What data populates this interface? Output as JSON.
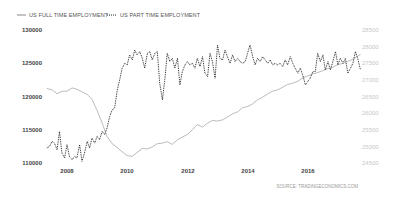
{
  "chart_data": {
    "type": "line",
    "title": "",
    "legend": [
      {
        "name": "US FULL TIME EMPLOYMENT",
        "style": "solid",
        "color": "#aaaaaa",
        "axis": "left"
      },
      {
        "name": "US PART TIME EMPLOYMENT",
        "style": "dotted",
        "color": "#222222",
        "axis": "right"
      }
    ],
    "legend_position": "top-left",
    "xlabel": "",
    "x_ticks": [
      "2008",
      "2010",
      "2012",
      "2014",
      "2016"
    ],
    "y_left": {
      "ticks": [
        "130000",
        "125000",
        "120000",
        "115000",
        "110000"
      ],
      "ylim": [
        110000,
        130000
      ]
    },
    "y_right": {
      "ticks": [
        "28500",
        "28000",
        "27500",
        "27000",
        "26500",
        "26000",
        "25500",
        "25000",
        "24500"
      ],
      "ylim": [
        24500,
        28500
      ]
    },
    "grid": false,
    "source": "SOURCE: TRADINGECONOMICS.COM",
    "x_range": [
      2007.33,
      2017.75
    ],
    "series": [
      {
        "name": "US FULL TIME EMPLOYMENT",
        "axis": "left",
        "x": [
          2007.33,
          2007.5,
          2007.67,
          2007.83,
          2008.0,
          2008.17,
          2008.33,
          2008.5,
          2008.67,
          2008.83,
          2009.0,
          2009.17,
          2009.33,
          2009.5,
          2009.67,
          2009.83,
          2010.0,
          2010.17,
          2010.33,
          2010.5,
          2010.67,
          2010.83,
          2011.0,
          2011.17,
          2011.33,
          2011.5,
          2011.67,
          2011.83,
          2012.0,
          2012.17,
          2012.33,
          2012.5,
          2012.67,
          2012.83,
          2013.0,
          2013.17,
          2013.33,
          2013.5,
          2013.67,
          2013.83,
          2014.0,
          2014.17,
          2014.33,
          2014.5,
          2014.67,
          2014.83,
          2015.0,
          2015.17,
          2015.33,
          2015.5,
          2015.67,
          2015.83,
          2016.0,
          2016.17,
          2016.33,
          2016.5,
          2016.67,
          2016.83,
          2017.0,
          2017.17,
          2017.33,
          2017.5,
          2017.67,
          2017.75
        ],
        "values": [
          121200,
          121000,
          120400,
          120800,
          120800,
          121300,
          121100,
          120700,
          120300,
          119600,
          117900,
          116000,
          114000,
          112900,
          112300,
          111700,
          111100,
          111000,
          111600,
          112200,
          112100,
          112400,
          112900,
          113000,
          113200,
          112800,
          113500,
          113900,
          114300,
          115000,
          115800,
          115400,
          116000,
          116400,
          116300,
          116500,
          116900,
          117400,
          117700,
          118300,
          118500,
          118900,
          119500,
          119900,
          120400,
          120800,
          121000,
          121400,
          121800,
          122000,
          122300,
          122800,
          123100,
          123400,
          123600,
          123900,
          124200,
          124400,
          124800,
          125000,
          125300,
          125600,
          126100,
          126300
        ]
      },
      {
        "name": "US PART TIME EMPLOYMENT",
        "axis": "right",
        "x": [
          2007.33,
          2007.42,
          2007.5,
          2007.58,
          2007.67,
          2007.75,
          2007.83,
          2007.92,
          2008.0,
          2008.08,
          2008.17,
          2008.25,
          2008.33,
          2008.42,
          2008.5,
          2008.58,
          2008.67,
          2008.75,
          2008.83,
          2008.92,
          2009.0,
          2009.08,
          2009.17,
          2009.25,
          2009.33,
          2009.42,
          2009.5,
          2009.58,
          2009.67,
          2009.75,
          2009.83,
          2009.92,
          2010.0,
          2010.08,
          2010.17,
          2010.25,
          2010.33,
          2010.42,
          2010.5,
          2010.58,
          2010.67,
          2010.75,
          2010.83,
          2010.92,
          2011.0,
          2011.08,
          2011.17,
          2011.25,
          2011.33,
          2011.42,
          2011.5,
          2011.58,
          2011.67,
          2011.75,
          2011.83,
          2011.92,
          2012.0,
          2012.08,
          2012.17,
          2012.25,
          2012.33,
          2012.42,
          2012.5,
          2012.58,
          2012.67,
          2012.75,
          2012.83,
          2012.92,
          2013.0,
          2013.08,
          2013.17,
          2013.25,
          2013.33,
          2013.42,
          2013.5,
          2013.58,
          2013.67,
          2013.75,
          2013.83,
          2013.92,
          2014.0,
          2014.08,
          2014.17,
          2014.25,
          2014.33,
          2014.42,
          2014.5,
          2014.58,
          2014.67,
          2014.75,
          2014.83,
          2014.92,
          2015.0,
          2015.08,
          2015.17,
          2015.25,
          2015.33,
          2015.42,
          2015.5,
          2015.58,
          2015.67,
          2015.75,
          2015.83,
          2015.92,
          2016.0,
          2016.08,
          2016.17,
          2016.25,
          2016.33,
          2016.42,
          2016.5,
          2016.58,
          2016.67,
          2016.75,
          2016.83,
          2016.92,
          2017.0,
          2017.08,
          2017.17,
          2017.25,
          2017.33,
          2017.42,
          2017.5,
          2017.58,
          2017.67,
          2017.75
        ],
        "values": [
          24950,
          25000,
          25150,
          25100,
          24900,
          25450,
          24800,
          24650,
          25050,
          24700,
          24600,
          24700,
          24650,
          25050,
          24550,
          24800,
          25150,
          24950,
          25250,
          25100,
          25300,
          25200,
          25450,
          25350,
          25550,
          25900,
          26100,
          26150,
          26700,
          27000,
          27350,
          27500,
          27450,
          27750,
          27600,
          27900,
          27750,
          27850,
          27650,
          27350,
          27800,
          27850,
          27600,
          27800,
          27850,
          26900,
          26400,
          27000,
          27800,
          27550,
          27650,
          27350,
          27650,
          26850,
          27250,
          27450,
          27550,
          27450,
          27500,
          27350,
          27650,
          27400,
          27700,
          27200,
          27100,
          27800,
          27550,
          27050,
          28050,
          27650,
          27600,
          27900,
          27700,
          27500,
          27750,
          27550,
          27650,
          27550,
          27500,
          27550,
          27800,
          28050,
          27700,
          27450,
          27650,
          27550,
          27700,
          27600,
          27500,
          27600,
          27450,
          27500,
          27450,
          27500,
          27400,
          27600,
          27450,
          27700,
          27500,
          27350,
          27200,
          27350,
          27150,
          26850,
          26950,
          27050,
          27250,
          27250,
          27800,
          27550,
          27750,
          27300,
          27550,
          27300,
          27550,
          27850,
          27450,
          27650,
          27500,
          27650,
          27200,
          27350,
          27500,
          27850,
          27600,
          27300
        ]
      }
    ]
  },
  "legend": {
    "full_time_label": "US FULL TIME EMPLOYMENT",
    "part_time_label": "US PART TIME EMPLOYMENT"
  },
  "axes": {
    "left_ticks": [
      "130000",
      "125000",
      "120000",
      "115000",
      "110000"
    ],
    "right_ticks": [
      "28500",
      "28000",
      "27500",
      "27000",
      "26500",
      "26000",
      "25500",
      "25000",
      "24500"
    ],
    "x_ticks": [
      "2008",
      "2010",
      "2012",
      "2014",
      "2016"
    ]
  },
  "source_label": "SOURCE: TRADINGECONOMICS.COM",
  "colors": {
    "full_time_line": "#aaaaaa",
    "part_time_line": "#222222"
  }
}
